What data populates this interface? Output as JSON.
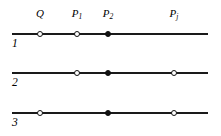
{
  "figure": {
    "width": 221,
    "height": 136,
    "background": "#ffffff",
    "line_color": "#1a1a1a",
    "marker_fill_color": "#111111",
    "marker_open_color": "#ffffff"
  },
  "column_labels": [
    {
      "id": "label-Q",
      "text": "Q",
      "sub": "",
      "x": 40,
      "y": 8
    },
    {
      "id": "label-P1",
      "text": "P",
      "sub": "1",
      "x": 77,
      "y": 8
    },
    {
      "id": "label-P2",
      "text": "P",
      "sub": "2",
      "x": 108,
      "y": 8
    },
    {
      "id": "label-Pj",
      "text": "P",
      "sub": "j",
      "x": 174,
      "y": 8
    }
  ],
  "rows": [
    {
      "id": "row-1",
      "label": "1",
      "label_x": 12,
      "label_y": 38,
      "line_y": 33,
      "line_x1": 12,
      "line_x2": 208,
      "markers": [
        {
          "name": "marker-row1-Q",
          "x": 40,
          "type": "open"
        },
        {
          "name": "marker-row1-P1",
          "x": 77,
          "type": "open"
        },
        {
          "name": "marker-row1-P2",
          "x": 108,
          "type": "filled"
        }
      ]
    },
    {
      "id": "row-2",
      "label": "2",
      "label_x": 12,
      "label_y": 77,
      "line_y": 72,
      "line_x1": 12,
      "line_x2": 208,
      "markers": [
        {
          "name": "marker-row2-P1",
          "x": 77,
          "type": "open"
        },
        {
          "name": "marker-row2-P2",
          "x": 108,
          "type": "filled"
        },
        {
          "name": "marker-row2-Pj",
          "x": 174,
          "type": "open"
        }
      ]
    },
    {
      "id": "row-3",
      "label": "3",
      "label_x": 12,
      "label_y": 117,
      "line_y": 112,
      "line_x1": 12,
      "line_x2": 208,
      "markers": [
        {
          "name": "marker-row3-Q",
          "x": 40,
          "type": "open"
        },
        {
          "name": "marker-row3-P2",
          "x": 108,
          "type": "filled"
        },
        {
          "name": "marker-row3-Pj",
          "x": 174,
          "type": "open"
        }
      ]
    }
  ]
}
